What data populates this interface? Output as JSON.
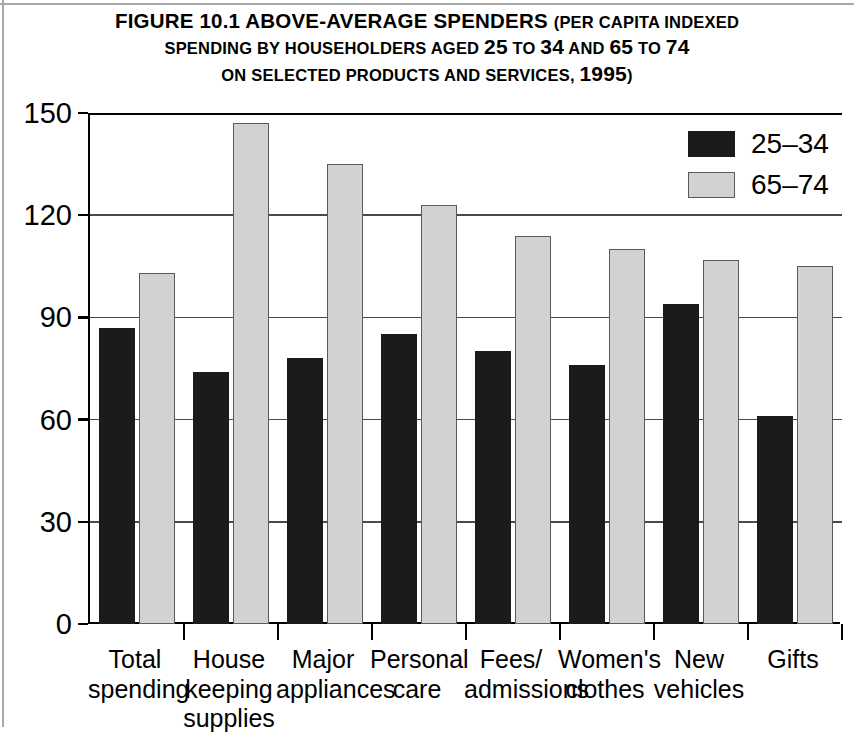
{
  "figure": {
    "title_lines": [
      "Figure 10.1 Above-Average Spenders (per capita indexed",
      "spending by householders aged 25 to 34 and 65 to 74",
      "on selected products and services, 1995)"
    ],
    "title_line_1_a": "Figure 10.1 ",
    "title_line_1_b": "Above-Average Spenders ",
    "title_line_1_c": "(per capita indexed",
    "title_line_2_a": "spending by householders aged ",
    "title_line_2_b": "25",
    "title_line_2_c": " to ",
    "title_line_2_d": "34",
    "title_line_2_e": " and ",
    "title_line_2_f": "65",
    "title_line_2_g": " to ",
    "title_line_2_h": "74",
    "title_line_3_a": "on selected products and services, ",
    "title_line_3_b": "1995",
    "title_line_3_c": ")"
  },
  "colors": {
    "series_25_34": "#1b1b1b",
    "series_65_74": "#d2d2d2",
    "series_65_74_border": "#5a5a5a",
    "axis": "#000000",
    "grid": "#4a4a4a",
    "background": "#ffffff"
  },
  "chart_data": {
    "type": "bar",
    "title": "Figure 10.1 Above-Average Spenders (per capita indexed spending by householders aged 25 to 34 and 65 to 74 on selected products and services, 1995)",
    "xlabel": "",
    "ylabel": "",
    "ylim": [
      0,
      150
    ],
    "yticks": [
      0,
      30,
      60,
      90,
      120,
      150
    ],
    "ytick_labels": [
      "0",
      "30",
      "60",
      "90",
      "120",
      "150"
    ],
    "grid": true,
    "legend_position": "top-right",
    "categories": [
      "Total spending",
      "House keeping supplies",
      "Major appliances",
      "Personal care",
      "Fees/ admissions",
      "Women's clothes",
      "New vehicles",
      "Gifts"
    ],
    "category_label_lines": [
      [
        "Total",
        "spending"
      ],
      [
        "House",
        "keeping",
        "supplies"
      ],
      [
        "Major",
        "appliances"
      ],
      [
        "Personal",
        "care"
      ],
      [
        "Fees/",
        "admissions"
      ],
      [
        "Women's",
        "clothes"
      ],
      [
        "New",
        "vehicles"
      ],
      [
        "Gifts"
      ]
    ],
    "series": [
      {
        "name": "25–34",
        "color": "#1b1b1b",
        "values": [
          87,
          74,
          78,
          85,
          80,
          76,
          94,
          61
        ]
      },
      {
        "name": "65–74",
        "color": "#d2d2d2",
        "values": [
          103,
          147,
          135,
          123,
          114,
          110,
          107,
          105
        ]
      }
    ]
  },
  "legend": {
    "entries": [
      {
        "label": "25–34",
        "swatch": "dark"
      },
      {
        "label": "65–74",
        "swatch": "light"
      }
    ]
  }
}
